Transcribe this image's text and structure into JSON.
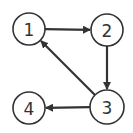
{
  "diagram": {
    "type": "directed-graph",
    "colors": {
      "stroke": "#333333",
      "background": "#ffffff",
      "node_fill": "#ffffff"
    },
    "nodes": [
      {
        "id": "1",
        "label": "1",
        "x": 29,
        "y": 29,
        "r": 16
      },
      {
        "id": "2",
        "label": "2",
        "x": 107,
        "y": 30,
        "r": 16
      },
      {
        "id": "3",
        "label": "3",
        "x": 107,
        "y": 107,
        "r": 17
      },
      {
        "id": "4",
        "label": "4",
        "x": 29,
        "y": 108,
        "r": 16
      }
    ],
    "edges": [
      {
        "from": "1",
        "to": "2"
      },
      {
        "from": "2",
        "to": "3"
      },
      {
        "from": "3",
        "to": "1"
      },
      {
        "from": "3",
        "to": "4"
      }
    ]
  }
}
